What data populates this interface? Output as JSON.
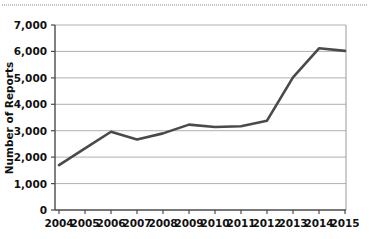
{
  "chart_data": {
    "type": "line",
    "title": "",
    "subtitle": "",
    "xlabel": "",
    "ylabel": "Number of Reports",
    "categories": [
      "2004",
      "2005",
      "2006",
      "2007",
      "2008",
      "2009",
      "2010",
      "2011",
      "2012",
      "2013",
      "2014",
      "2015"
    ],
    "x": [
      2004,
      2005,
      2006,
      2007,
      2008,
      2009,
      2010,
      2011,
      2012,
      2013,
      2014,
      2015
    ],
    "values": [
      1700,
      2330,
      2960,
      2670,
      2900,
      3230,
      3140,
      3170,
      3380,
      5020,
      6120,
      6020
    ],
    "series": [
      {
        "name": "Number of Reports",
        "values": [
          1700,
          2330,
          2960,
          2670,
          2900,
          3230,
          3140,
          3170,
          3380,
          5020,
          6120,
          6020
        ]
      }
    ],
    "ylim": [
      0,
      7000
    ],
    "ytick_values": [
      0,
      1000,
      2000,
      3000,
      4000,
      5000,
      6000,
      7000
    ],
    "ytick_labels": [
      "0",
      "1,000",
      "2,000",
      "3,000",
      "4,000",
      "5,000",
      "6,000",
      "7,000"
    ],
    "xtick_labels": [
      "2004",
      "2005",
      "2006",
      "2007",
      "2008",
      "2009",
      "2010",
      "2011",
      "2012",
      "2013",
      "2014",
      "2015"
    ],
    "grid": "horizontal",
    "legend": "none",
    "line_color": "#4a4a4a",
    "axis_color": "#5a5a5a",
    "gridline_color": "#b0b0b0",
    "background_color": "#ffffff",
    "annotations": []
  },
  "axes": {
    "y_title": "Number of Reports",
    "y_ticks": [
      {
        "label": "7,000"
      },
      {
        "label": "6,000"
      },
      {
        "label": "5,000"
      },
      {
        "label": "4,000"
      },
      {
        "label": "3,000"
      },
      {
        "label": "2,000"
      },
      {
        "label": "1,000"
      },
      {
        "label": "0"
      }
    ],
    "x_ticks": [
      {
        "label": "2004"
      },
      {
        "label": "2005"
      },
      {
        "label": "2006"
      },
      {
        "label": "2007"
      },
      {
        "label": "2008"
      },
      {
        "label": "2009"
      },
      {
        "label": "2010"
      },
      {
        "label": "2011"
      },
      {
        "label": "2012"
      },
      {
        "label": "2013"
      },
      {
        "label": "2014"
      },
      {
        "label": "2015"
      }
    ]
  }
}
